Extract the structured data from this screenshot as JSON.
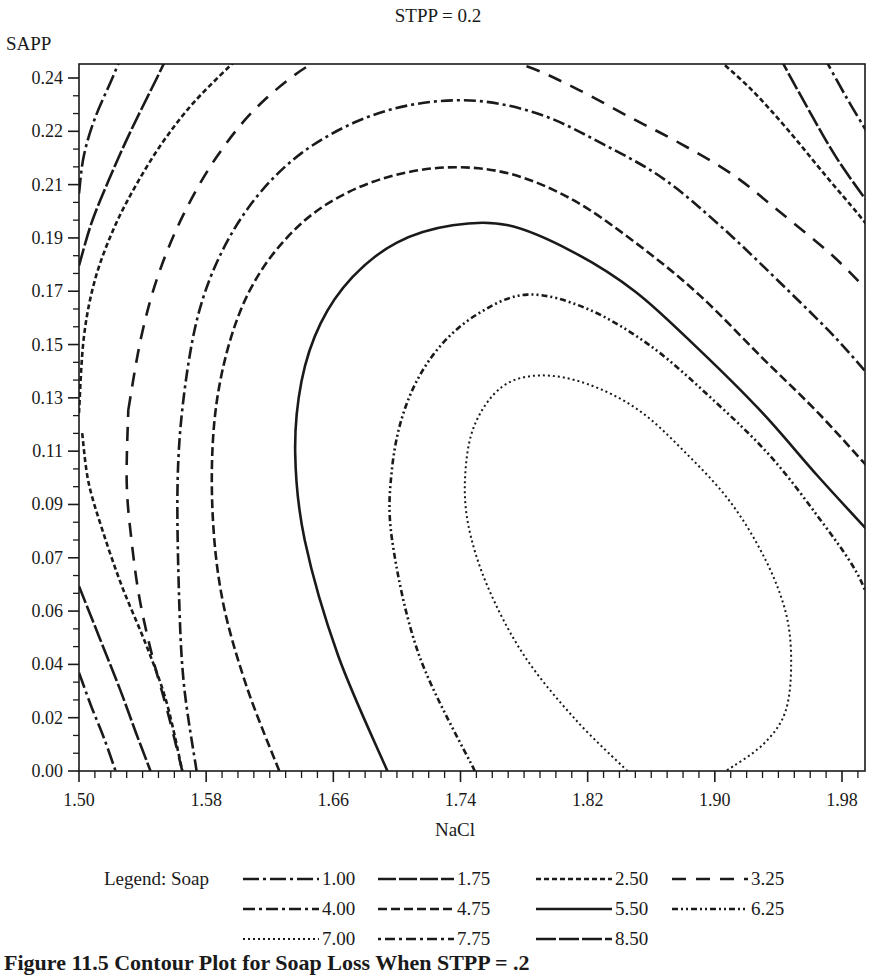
{
  "figure": {
    "title": "STPP = 0.2",
    "caption": "Figure 11.5  Contour Plot for Soap Loss When STPP = .2"
  },
  "chart_data": {
    "type": "contour",
    "title": "STPP = 0.2",
    "xlabel": "NaCl",
    "ylabel": "SAPP",
    "x_ticks": [
      "1.50",
      "1.58",
      "1.66",
      "1.74",
      "1.82",
      "1.90",
      "1.98"
    ],
    "y_ticks": [
      "0.24",
      "0.22",
      "0.21",
      "0.19",
      "0.17",
      "0.15",
      "0.13",
      "0.11",
      "0.09",
      "0.07",
      "0.06",
      "0.04",
      "0.02",
      "0.00"
    ],
    "xlim": [
      1.5,
      2.0
    ],
    "ylim": [
      0.0,
      0.25
    ],
    "legend_title": "Legend: Soap",
    "legend_position": "bottom",
    "grid": false,
    "response": "Soap",
    "fixed_factor": {
      "name": "STPP",
      "value": 0.2
    },
    "levels": [
      {
        "value": "1.00",
        "style": "long-dash-dot"
      },
      {
        "value": "1.75",
        "style": "long-dash"
      },
      {
        "value": "2.50",
        "style": "short-dash"
      },
      {
        "value": "3.25",
        "style": "wide-dash"
      },
      {
        "value": "4.00",
        "style": "dash-dot"
      },
      {
        "value": "4.75",
        "style": "dash"
      },
      {
        "value": "5.50",
        "style": "solid"
      },
      {
        "value": "6.25",
        "style": "dash-dot-dot"
      },
      {
        "value": "7.00",
        "style": "dotted"
      },
      {
        "value": "7.75",
        "style": "dot-dash-spaced"
      },
      {
        "value": "8.50",
        "style": "long-dash-short"
      }
    ],
    "contours": [
      {
        "level": "1.00",
        "segments": [
          [
            [
              1.5,
              0.2
            ],
            [
              1.503,
              0.213
            ],
            [
              1.51,
              0.226
            ],
            [
              1.521,
              0.24
            ],
            [
              1.527,
              0.248
            ]
          ],
          [
            [
              1.5,
              0.034
            ],
            [
              1.508,
              0.022
            ],
            [
              1.516,
              0.011
            ],
            [
              1.523,
              0.0
            ]
          ],
          [
            [
              1.968,
              0.248
            ],
            [
              1.982,
              0.234
            ],
            [
              1.996,
              0.221
            ],
            [
              2.0,
              0.217
            ]
          ]
        ]
      },
      {
        "level": "1.75",
        "segments": [
          [
            [
              1.5,
              0.175
            ],
            [
              1.508,
              0.19
            ],
            [
              1.519,
              0.205
            ],
            [
              1.532,
              0.221
            ],
            [
              1.549,
              0.24
            ],
            [
              1.556,
              0.248
            ]
          ],
          [
            [
              1.5,
              0.064
            ],
            [
              1.513,
              0.046
            ],
            [
              1.526,
              0.028
            ],
            [
              1.536,
              0.013
            ],
            [
              1.545,
              0.0
            ]
          ],
          [
            [
              1.94,
              0.248
            ],
            [
              1.958,
              0.23
            ],
            [
              1.977,
              0.212
            ],
            [
              2.0,
              0.194
            ]
          ]
        ]
      },
      {
        "level": "2.50",
        "segments": [
          [
            [
              1.5,
              0.124
            ],
            [
              1.503,
              0.15
            ],
            [
              1.51,
              0.17
            ],
            [
              1.522,
              0.188
            ],
            [
              1.536,
              0.203
            ],
            [
              1.553,
              0.218
            ],
            [
              1.573,
              0.232
            ],
            [
              1.602,
              0.248
            ]
          ],
          [
            [
              1.502,
              0.117
            ],
            [
              1.506,
              0.1
            ],
            [
              1.515,
              0.083
            ],
            [
              1.527,
              0.064
            ],
            [
              1.542,
              0.044
            ],
            [
              1.555,
              0.024
            ],
            [
              1.565,
              0.0
            ]
          ],
          [
            [
              1.899,
              0.248
            ],
            [
              1.923,
              0.236
            ],
            [
              1.946,
              0.222
            ],
            [
              1.97,
              0.206
            ],
            [
              1.99,
              0.193
            ],
            [
              2.0,
              0.186
            ]
          ]
        ]
      },
      {
        "level": "3.25",
        "segments": [
          [
            [
              1.545,
              0.0
            ],
            [
              1.549,
              0.02
            ],
            [
              1.553,
              0.04
            ],
            [
              1.559,
              0.06
            ],
            [
              1.564,
              0.08
            ],
            [
              1.531,
              0.125
            ],
            [
              1.539,
              0.15
            ],
            [
              1.55,
              0.172
            ],
            [
              1.566,
              0.193
            ],
            [
              1.587,
              0.213
            ],
            [
              1.614,
              0.231
            ],
            [
              1.65,
              0.246
            ],
            [
              1.683,
              0.25
            ],
            [
              1.752,
              0.248
            ],
            [
              1.782,
              0.244
            ],
            [
              1.814,
              0.236
            ],
            [
              1.848,
              0.226
            ],
            [
              1.876,
              0.218
            ],
            [
              1.91,
              0.207
            ],
            [
              1.94,
              0.194
            ],
            [
              1.975,
              0.178
            ],
            [
              2.0,
              0.164
            ]
          ]
        ]
      },
      {
        "level": "4.00",
        "segments": [
          [
            [
              1.574,
              0.0
            ],
            [
              1.566,
              0.03
            ],
            [
              1.563,
              0.06
            ],
            [
              1.562,
              0.1
            ],
            [
              1.566,
              0.13
            ],
            [
              1.575,
              0.158
            ],
            [
              1.59,
              0.18
            ],
            [
              1.612,
              0.199
            ],
            [
              1.64,
              0.214
            ],
            [
              1.675,
              0.225
            ],
            [
              1.712,
              0.231
            ],
            [
              1.752,
              0.232
            ],
            [
              1.792,
              0.227
            ],
            [
              1.83,
              0.217
            ],
            [
              1.868,
              0.205
            ],
            [
              1.905,
              0.188
            ],
            [
              1.945,
              0.167
            ],
            [
              1.976,
              0.15
            ],
            [
              2.0,
              0.135
            ]
          ]
        ]
      },
      {
        "level": "4.75",
        "segments": [
          [
            [
              1.626,
              0.0
            ],
            [
              1.605,
              0.03
            ],
            [
              1.59,
              0.06
            ],
            [
              1.584,
              0.09
            ],
            [
              1.585,
              0.12
            ],
            [
              1.593,
              0.145
            ],
            [
              1.607,
              0.166
            ],
            [
              1.628,
              0.183
            ],
            [
              1.655,
              0.196
            ],
            [
              1.69,
              0.205
            ],
            [
              1.73,
              0.209
            ],
            [
              1.77,
              0.207
            ],
            [
              1.81,
              0.198
            ],
            [
              1.85,
              0.183
            ],
            [
              1.89,
              0.165
            ],
            [
              1.93,
              0.143
            ],
            [
              1.965,
              0.124
            ],
            [
              2.0,
              0.103
            ]
          ]
        ]
      },
      {
        "level": "5.50",
        "segments": [
          [
            [
              1.694,
              0.0
            ],
            [
              1.663,
              0.04
            ],
            [
              1.642,
              0.08
            ],
            [
              1.636,
              0.11
            ],
            [
              1.64,
              0.135
            ],
            [
              1.652,
              0.155
            ],
            [
              1.672,
              0.171
            ],
            [
              1.7,
              0.183
            ],
            [
              1.735,
              0.189
            ],
            [
              1.77,
              0.189
            ],
            [
              1.81,
              0.18
            ],
            [
              1.85,
              0.166
            ],
            [
              1.89,
              0.146
            ],
            [
              1.93,
              0.124
            ],
            [
              1.965,
              0.102
            ],
            [
              2.0,
              0.081
            ]
          ]
        ]
      },
      {
        "level": "6.25",
        "segments": [
          [
            [
              1.749,
              0.0
            ],
            [
              1.714,
              0.04
            ],
            [
              1.697,
              0.08
            ],
            [
              1.697,
              0.105
            ],
            [
              1.706,
              0.127
            ],
            [
              1.724,
              0.145
            ],
            [
              1.75,
              0.158
            ],
            [
              1.782,
              0.165
            ],
            [
              1.82,
              0.16
            ],
            [
              1.86,
              0.147
            ],
            [
              1.9,
              0.128
            ],
            [
              1.935,
              0.109
            ],
            [
              1.965,
              0.088
            ],
            [
              1.989,
              0.069
            ],
            [
              2.0,
              0.054
            ]
          ]
        ]
      },
      {
        "level": "7.00",
        "segments": [
          [
            [
              1.845,
              0.0
            ],
            [
              1.812,
              0.018
            ],
            [
              1.78,
              0.04
            ],
            [
              1.757,
              0.064
            ],
            [
              1.745,
              0.085
            ],
            [
              1.743,
              0.103
            ],
            [
              1.749,
              0.12
            ],
            [
              1.766,
              0.133
            ],
            [
              1.79,
              0.137
            ],
            [
              1.82,
              0.134
            ],
            [
              1.852,
              0.125
            ],
            [
              1.882,
              0.11
            ],
            [
              1.91,
              0.093
            ],
            [
              1.932,
              0.073
            ],
            [
              1.945,
              0.054
            ],
            [
              1.948,
              0.036
            ],
            [
              1.944,
              0.02
            ],
            [
              1.93,
              0.009
            ],
            [
              1.907,
              0.0
            ]
          ]
        ]
      }
    ]
  }
}
